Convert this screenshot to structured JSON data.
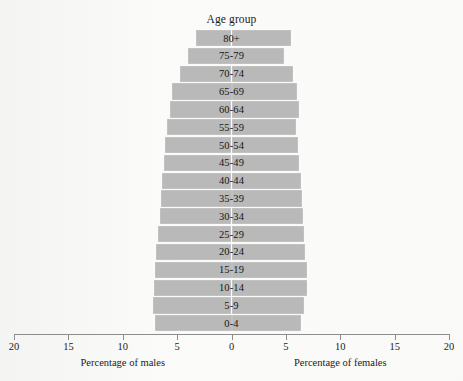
{
  "chart_data": {
    "type": "bar",
    "subtype": "population-pyramid",
    "title": "Age group",
    "xlabel_left": "Percentage of males",
    "xlabel_right": "Percentage of females",
    "ylabel": "",
    "grid": false,
    "legend": "none",
    "axis": {
      "tick_labels": [
        "20",
        "15",
        "10",
        "5",
        "0",
        "5",
        "10",
        "15",
        "20"
      ],
      "tick_values": [
        20,
        15,
        10,
        5,
        0,
        5,
        10,
        15,
        20
      ],
      "max_percent": 20,
      "center_value": 0
    },
    "categories": [
      "80+",
      "75-79",
      "70-74",
      "65-69",
      "60-64",
      "55-59",
      "50-54",
      "45-49",
      "40-44",
      "35-39",
      "30-34",
      "25-29",
      "20-24",
      "15-19",
      "10-14",
      "5-9",
      "0-4"
    ],
    "series": [
      {
        "name": "Percentage of males",
        "side": "left",
        "values": [
          3.3,
          4.0,
          4.7,
          5.5,
          5.7,
          5.9,
          6.1,
          6.2,
          6.4,
          6.5,
          6.6,
          6.8,
          6.9,
          7.0,
          7.1,
          7.2,
          7.0
        ]
      },
      {
        "name": "Percentage of females",
        "side": "right",
        "values": [
          5.5,
          4.8,
          5.7,
          6.0,
          6.2,
          5.9,
          6.1,
          6.2,
          6.4,
          6.5,
          6.6,
          6.7,
          6.8,
          6.9,
          6.9,
          6.7,
          6.4
        ]
      }
    ],
    "bar_color": "#b9b9b9"
  },
  "figure": {
    "title": "Age group",
    "axis_caption_left": "Percentage of males",
    "axis_caption_right": "Percentage of females"
  }
}
